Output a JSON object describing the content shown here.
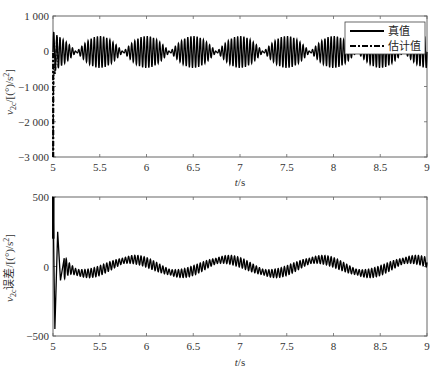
{
  "chart_data": [
    {
      "type": "line",
      "title": "",
      "xlabel": "t/s",
      "ylabel": "ν2c/[(°)/s²]",
      "xlim": [
        5,
        9
      ],
      "ylim": [
        -3000,
        1000
      ],
      "xticks": [
        5,
        5.5,
        6,
        6.5,
        7,
        7.5,
        8,
        8.5,
        9
      ],
      "xtick_labels": [
        "5",
        "5.5",
        "6",
        "6.5",
        "7",
        "7.5",
        "8",
        "8.5",
        "9"
      ],
      "yticks": [
        -3000,
        -2000,
        -1000,
        0,
        1000
      ],
      "ytick_labels": [
        "−3 000",
        "−2 000",
        "−1 000",
        "0",
        "1 000"
      ],
      "grid": false,
      "legend_position": "upper right",
      "series": [
        {
          "name": "真值",
          "style": "solid",
          "description": "beating oscillation around 0, envelope peaks ≈ ±450 at t ≈ 5.5, 6.0, ..., 9.0, nodes between",
          "carrier_hz": 30,
          "envelope_amplitude": 450,
          "envelope_period_s": 0.5,
          "envelope_peak_t": 5.5
        },
        {
          "name": "估计值",
          "style": "dash-dot",
          "description": "starts at ≈ −3000 at t = 5 and converges to true value within ~0.05 s",
          "initial_value": -3000
        }
      ]
    },
    {
      "type": "line",
      "title": "",
      "xlabel": "t/s",
      "ylabel": "ν2c误差/[(°)/s²]",
      "xlim": [
        5,
        9
      ],
      "ylim": [
        -500,
        500
      ],
      "xticks": [
        5,
        5.5,
        6,
        6.5,
        7,
        7.5,
        8,
        8.5,
        9
      ],
      "xtick_labels": [
        "5",
        "5.5",
        "6",
        "6.5",
        "7",
        "7.5",
        "8",
        "8.5",
        "9"
      ],
      "yticks": [
        -500,
        0,
        500
      ],
      "ytick_labels": [
        "−500",
        "0",
        "500"
      ],
      "grid": false,
      "series": [
        {
          "name": "误差",
          "style": "solid",
          "description": "initial transient: +500 → −450 → +250 decaying within ~0.1 s; then slow wave (amp ≈ 50, period ≈ 1 s, peaks ≈ 5.85, 6.85, 7.85, 8.85) with high-frequency ripple ≈ ±35",
          "transient_points": [
            [
              5.0,
              500
            ],
            [
              5.02,
              -450
            ],
            [
              5.05,
              250
            ],
            [
              5.08,
              -100
            ],
            [
              5.12,
              60
            ]
          ],
          "slow_wave_amplitude": 50,
          "slow_wave_period_s": 1.0,
          "slow_wave_peak_t": 5.85,
          "ripple_amplitude": 35,
          "ripple_hz": 30
        }
      ]
    }
  ],
  "top": {
    "ylabel": "ν2c/[(°)/s²]",
    "xlabel": "t/s",
    "legend": {
      "true_label": "真值",
      "est_label": "估计值"
    }
  },
  "bottom": {
    "ylabel": "ν2c误差/[(°)/s²]",
    "xlabel": "t/s"
  }
}
